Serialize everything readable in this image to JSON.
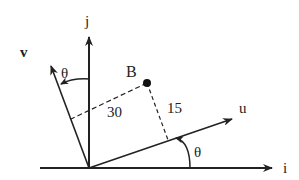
{
  "diagram": {
    "title": "",
    "colors": {
      "line": "#222222",
      "background": "#ffffff"
    },
    "origin": {
      "x": 89,
      "y": 168
    },
    "axes": {
      "i": {
        "label": "i",
        "tip": {
          "x": 272,
          "y": 168
        }
      },
      "j": {
        "label": "j",
        "tip": {
          "x": 89,
          "y": 37
        }
      }
    },
    "vectors": {
      "u": {
        "label": "u",
        "tip": {
          "x": 232,
          "y": 119
        }
      },
      "v": {
        "label": "v",
        "tip": {
          "x": 50,
          "y": 65
        }
      }
    },
    "angles": [
      {
        "name": "theta-u",
        "label": "θ"
      },
      {
        "name": "theta-v",
        "label": "θ"
      }
    ],
    "point": {
      "label": "B",
      "x": 147,
      "y": 83
    },
    "projections": [
      {
        "name": "projection-on-v",
        "label": "30"
      },
      {
        "name": "projection-on-u",
        "label": "15"
      }
    ]
  }
}
